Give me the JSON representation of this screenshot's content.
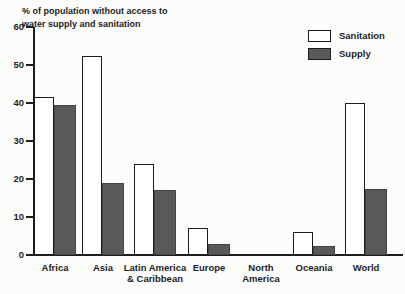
{
  "chart_data": {
    "type": "bar",
    "title": "% of population without access to water supply and sanitation",
    "categories": [
      "Africa",
      "Asia",
      "Latin America & Caribbean",
      "Europe",
      "North America",
      "Oceania",
      "World"
    ],
    "category_label_lines": [
      [
        "Africa"
      ],
      [
        "Asia"
      ],
      [
        "Latin America",
        "& Caribbean"
      ],
      [
        "Europe"
      ],
      [
        "North",
        "America"
      ],
      [
        "Oceania"
      ],
      [
        "World"
      ]
    ],
    "series": [
      {
        "name": "Sanitation",
        "values": [
          41.5,
          52.5,
          24,
          7,
          0,
          6,
          40
        ],
        "fill": "#ffffff",
        "border": "#1c1c1c"
      },
      {
        "name": "Supply",
        "values": [
          39.5,
          19,
          17,
          3,
          0,
          2.5,
          17.5
        ],
        "fill": "#595959",
        "border": "#454545"
      }
    ],
    "ylim": [
      0,
      60
    ],
    "yticks": [
      0,
      10,
      20,
      30,
      40,
      50,
      60
    ],
    "xlabel": "",
    "ylabel": "",
    "grid": false,
    "legend_position": "top-right",
    "axis_color": "#1c1c1c",
    "background": "#fcfcfa"
  }
}
